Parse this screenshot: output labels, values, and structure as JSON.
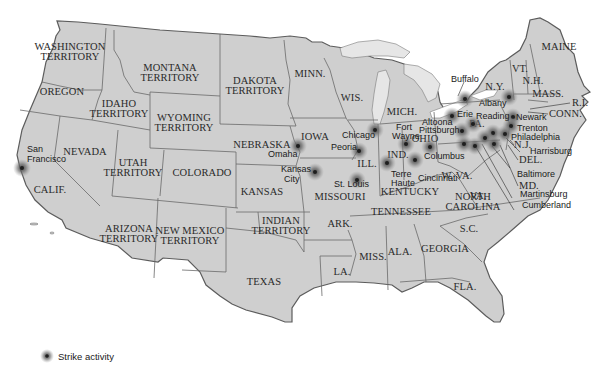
{
  "map": {
    "title": "Strike activity map of the United States",
    "colors": {
      "land": "#cfcfcf",
      "land_light": "#dadada",
      "border": "#6a6a6a",
      "coast": "#5c5c5c",
      "water": "#ffffff",
      "lakes": "#e4e4e4",
      "marker": "#1e1e1e",
      "marker_glow": "#6c6c6c"
    },
    "regions": [
      {
        "name": "WASHINGTON TERRITORY",
        "line1": "WASHINGTON",
        "line2": "TERRITORY"
      },
      {
        "name": "OREGON",
        "line1": "OREGON"
      },
      {
        "name": "IDAHO TERRITORY",
        "line1": "IDAHO",
        "line2": "TERRITORY"
      },
      {
        "name": "MONTANA TERRITORY",
        "line1": "MONTANA",
        "line2": "TERRITORY"
      },
      {
        "name": "WYOMING TERRITORY",
        "line1": "WYOMING",
        "line2": "TERRITORY"
      },
      {
        "name": "DAKOTA TERRITORY",
        "line1": "DAKOTA",
        "line2": "TERRITORY"
      },
      {
        "name": "MINN.",
        "line1": "MINN."
      },
      {
        "name": "WIS.",
        "line1": "WIS."
      },
      {
        "name": "MICH.",
        "line1": "MICH."
      },
      {
        "name": "NEBRASKA",
        "line1": "NEBRASKA"
      },
      {
        "name": "IOWA",
        "line1": "IOWA"
      },
      {
        "name": "ILL.",
        "line1": "ILL."
      },
      {
        "name": "IND.",
        "line1": "IND."
      },
      {
        "name": "OHIO",
        "line1": "OHIO"
      },
      {
        "name": "PA.",
        "line1": "PA."
      },
      {
        "name": "N.Y.",
        "line1": "N.Y."
      },
      {
        "name": "VT.",
        "line1": "VT."
      },
      {
        "name": "N.H.",
        "line1": "N.H."
      },
      {
        "name": "MAINE",
        "line1": "MAINE"
      },
      {
        "name": "MASS.",
        "line1": "MASS."
      },
      {
        "name": "R.I.",
        "line1": "R.I."
      },
      {
        "name": "CONN.",
        "line1": "CONN."
      },
      {
        "name": "N.J.",
        "line1": "N.J."
      },
      {
        "name": "DEL.",
        "line1": "DEL."
      },
      {
        "name": "MD.",
        "line1": "MD."
      },
      {
        "name": "NEVADA",
        "line1": "NEVADA"
      },
      {
        "name": "CALIF.",
        "line1": "CALIF."
      },
      {
        "name": "UTAH TERRITORY",
        "line1": "UTAH",
        "line2": "TERRITORY"
      },
      {
        "name": "COLORADO",
        "line1": "COLORADO"
      },
      {
        "name": "KANSAS",
        "line1": "KANSAS"
      },
      {
        "name": "MISSOURI",
        "line1": "MISSOURI"
      },
      {
        "name": "KENTUCKY",
        "line1": "KENTUCKY"
      },
      {
        "name": "W. VA.",
        "line1": "W. VA."
      },
      {
        "name": "VA.",
        "line1": "VA."
      },
      {
        "name": "ARIZONA TERRITORY",
        "line1": "ARIZONA",
        "line2": "TERRITORY"
      },
      {
        "name": "NEW MEXICO TERRITORY",
        "line1": "NEW MEXICO",
        "line2": "TERRITORY"
      },
      {
        "name": "INDIAN TERRITORY",
        "line1": "INDIAN",
        "line2": "TERRITORY"
      },
      {
        "name": "ARK.",
        "line1": "ARK."
      },
      {
        "name": "TENNESSEE",
        "line1": "TENNESSEE"
      },
      {
        "name": "NORTH CAROLINA",
        "line1": "NORTH",
        "line2": "CAROLINA"
      },
      {
        "name": "S.C.",
        "line1": "S.C."
      },
      {
        "name": "GEORGIA",
        "line1": "GEORGIA"
      },
      {
        "name": "ALA.",
        "line1": "ALA."
      },
      {
        "name": "MISS.",
        "line1": "MISS."
      },
      {
        "name": "LA.",
        "line1": "LA."
      },
      {
        "name": "TEXAS",
        "line1": "TEXAS"
      },
      {
        "name": "FLA.",
        "line1": "FLA."
      }
    ],
    "cities": [
      {
        "name": "San Francisco",
        "line1": "San",
        "line2": "Francisco"
      },
      {
        "name": "Omaha",
        "line1": "Omaha"
      },
      {
        "name": "Kansas City",
        "line1": "Kansas",
        "line2": "City"
      },
      {
        "name": "St. Louis",
        "line1": "St. Louis"
      },
      {
        "name": "Chicago",
        "line1": "Chicago"
      },
      {
        "name": "Peoria",
        "line1": "Peoria"
      },
      {
        "name": "Fort Wayne",
        "line1": "Fort",
        "line2": "Wayne"
      },
      {
        "name": "Terre Haute",
        "line1": "Terre",
        "line2": "Haute"
      },
      {
        "name": "Cincinnati",
        "line1": "Cincinnati"
      },
      {
        "name": "Columbus",
        "line1": "Columbus"
      },
      {
        "name": "Altoona",
        "line1": "Altoona"
      },
      {
        "name": "Pittsburgh",
        "line1": "Pittsburgh"
      },
      {
        "name": "Erie",
        "line1": "Erie"
      },
      {
        "name": "Buffalo",
        "line1": "Buffalo"
      },
      {
        "name": "Albany",
        "line1": "Albany"
      },
      {
        "name": "Reading",
        "line1": "Reading"
      },
      {
        "name": "Newark",
        "line1": "Newark"
      },
      {
        "name": "Trenton",
        "line1": "Trenton"
      },
      {
        "name": "Philadelphia",
        "line1": "Philadelphia"
      },
      {
        "name": "Harrisburg",
        "line1": "Harrisburg"
      },
      {
        "name": "Baltimore",
        "line1": "Baltimore"
      },
      {
        "name": "Martinsburg",
        "line1": "Martinsburg"
      },
      {
        "name": "Cumberland",
        "line1": "Cumberland"
      }
    ],
    "legend": {
      "icon": "strike-marker-icon",
      "label": "Strike activity"
    }
  }
}
